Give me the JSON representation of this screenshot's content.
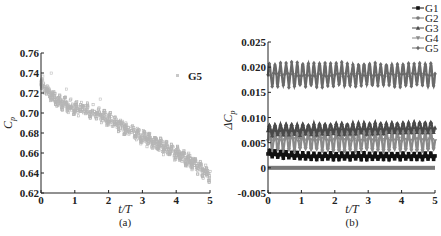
{
  "chart_data": [
    {
      "panel": "(a)",
      "type": "scatter",
      "title": "",
      "xlabel": "t/T",
      "ylabel": "C_p",
      "xlim": [
        0,
        5
      ],
      "ylim": [
        0.62,
        0.76
      ],
      "xticks": [
        "0",
        "1",
        "2",
        "3",
        "4",
        "5"
      ],
      "yticks": [
        "0.62",
        "0.64",
        "0.66",
        "0.68",
        "0.70",
        "0.72",
        "0.74",
        "0.76"
      ],
      "grid": false,
      "legend": {
        "position": "upper right",
        "entries": [
          "G5"
        ]
      },
      "series": [
        {
          "name": "G5",
          "color": "#b5b5b5",
          "trend": {
            "x": [
              0,
              0.5,
              1,
              1.5,
              2,
              2.5,
              3,
              3.5,
              4,
              4.5,
              5
            ],
            "y": [
              0.728,
              0.712,
              0.705,
              0.702,
              0.694,
              0.685,
              0.676,
              0.668,
              0.66,
              0.65,
              0.637
            ]
          },
          "spread": 0.006
        }
      ]
    },
    {
      "panel": "(b)",
      "type": "line",
      "title": "",
      "xlabel": "t/T",
      "ylabel": "ΔC_p",
      "xlim": [
        0,
        5
      ],
      "ylim": [
        -0.005,
        0.025
      ],
      "xticks": [
        "0",
        "1",
        "2",
        "3",
        "4",
        "5"
      ],
      "yticks": [
        "-0.005",
        "0",
        "0.005",
        "0.010",
        "0.015",
        "0.020",
        "0.025"
      ],
      "grid": false,
      "legend": {
        "position": "upper right",
        "entries": [
          "G1",
          "G2",
          "G3",
          "G4",
          "G5"
        ]
      },
      "series": [
        {
          "name": "G1",
          "marker": "square",
          "color": "#111111",
          "mean": 0.0025,
          "amplitude": 0.0006,
          "cycles": 30
        },
        {
          "name": "G2",
          "marker": "circle",
          "color": "#7a7a7a",
          "mean": 0.0,
          "amplitude": 0.0001,
          "cycles": 30
        },
        {
          "name": "G3",
          "marker": "triangle",
          "color": "#4a4a4a",
          "mean": 0.0078,
          "amplitude": 0.001,
          "cycles": 30
        },
        {
          "name": "G4",
          "marker": "down-triangle",
          "color": "#8a8a8a",
          "mean": 0.0055,
          "amplitude": 0.002,
          "cycles": 30
        },
        {
          "name": "G5",
          "marker": "diamond",
          "color": "#6a6a6a",
          "mean": 0.0185,
          "amplitude": 0.0022,
          "cycles": 30
        }
      ]
    }
  ],
  "captions": {
    "a": "(a)",
    "b": "(b)"
  },
  "figure_caption": ""
}
